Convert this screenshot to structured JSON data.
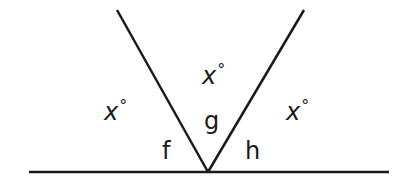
{
  "diagram": {
    "type": "angles-on-a-straight-line",
    "colors": {
      "line": "#1a1a1a",
      "background": "#ffffff"
    },
    "baseline": {
      "x1": 29,
      "y1": 172,
      "x2": 389,
      "y2": 172
    },
    "rays": [
      {
        "name": "left-ray",
        "x1": 208,
        "y1": 172,
        "x2": 117,
        "y2": 10
      },
      {
        "name": "right-ray",
        "x1": 208,
        "y1": 172,
        "x2": 304,
        "y2": 10
      }
    ],
    "labels": {
      "x_left": {
        "var": "x",
        "deg": "°"
      },
      "x_top": {
        "var": "x",
        "deg": "°"
      },
      "x_right": {
        "var": "x",
        "deg": "°"
      },
      "f": "f",
      "g": "g",
      "h": "h"
    }
  }
}
